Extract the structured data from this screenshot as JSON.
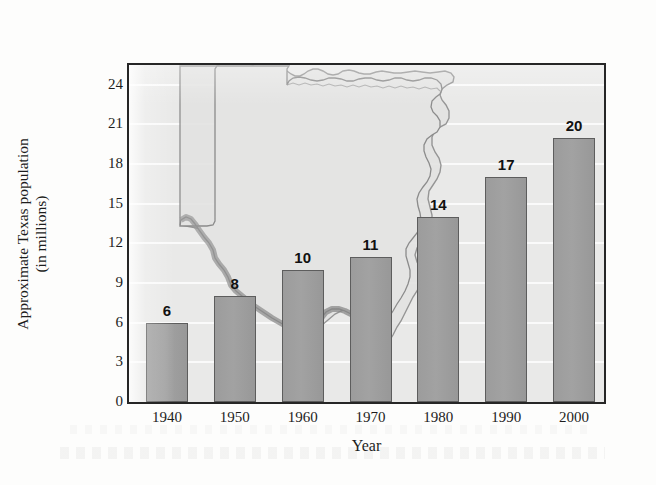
{
  "chart_data": {
    "type": "bar",
    "title": "",
    "subtitle": "",
    "xlabel": "Year",
    "ylabel": "Approximate Texas population (in millions)",
    "ylabel_line1": "Approximate Texas population",
    "ylabel_line2": "(in millions)",
    "categories": [
      "1940",
      "1950",
      "1960",
      "1970",
      "1980",
      "1990",
      "2000"
    ],
    "values": [
      6,
      8,
      10,
      11,
      14,
      17,
      20
    ],
    "bar_labels": [
      "6",
      "8",
      "10",
      "11",
      "14",
      "17",
      "20"
    ],
    "ylim": [
      0,
      25.5
    ],
    "xlim_note": "categorical decades",
    "yticks": [
      0,
      3,
      6,
      9,
      12,
      15,
      18,
      21,
      24
    ],
    "ytick_labels": [
      "0",
      "3",
      "6",
      "9",
      "12",
      "15",
      "18",
      "21",
      "24"
    ],
    "grid": "horizontal white gridlines at each y tick",
    "legend": "none",
    "legend_position": "none",
    "annotations": [
      "Outline map of Texas used as a background watermark behind the bars"
    ],
    "colors": {
      "bar_fill": "#9c9c9c",
      "bar_edge": "#5d5d5d",
      "plot_background": "#e9e9e8",
      "gridline": "#fbfbfb",
      "axis_frame": "#262626",
      "map_fill": "#e3e3e2",
      "map_edge": "#8d8d8d",
      "map_river_shade": "#8a8a8a",
      "text": "#1d1d1d",
      "page_background": "#fdfdfc"
    }
  },
  "axes": {
    "y_title_line1": "Approximate Texas population",
    "y_title_line2": "(in millions)",
    "x_title": "Year"
  },
  "icons": {
    "map_watermark": "texas-map-icon"
  }
}
